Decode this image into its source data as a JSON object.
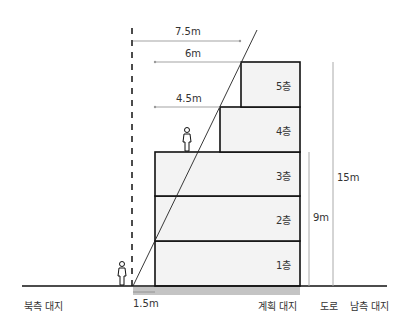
{
  "diagram": {
    "type": "building-section-sunlight-setback",
    "floors": [
      {
        "label": "1층"
      },
      {
        "label": "2층"
      },
      {
        "label": "3층"
      },
      {
        "label": "4층"
      },
      {
        "label": "5층"
      }
    ],
    "setback_dimensions": [
      {
        "label": "7.5m"
      },
      {
        "label": "6m"
      },
      {
        "label": "4.5m"
      },
      {
        "label": "1.5m"
      }
    ],
    "height_dimensions": [
      {
        "label": "9m"
      },
      {
        "label": "15m"
      }
    ],
    "ground_labels": {
      "north_site": "북측 대지",
      "planned_site": "계획 대지",
      "road": "도로",
      "south_site": "남측 대지"
    },
    "colors": {
      "building_fill": "#f2f2f2",
      "outline": "#111111",
      "dimension_line": "#999999",
      "site_band": "#bdbdbd"
    }
  }
}
